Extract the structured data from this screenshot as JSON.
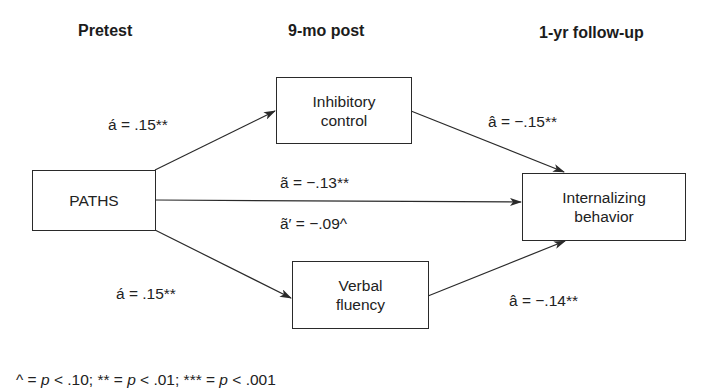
{
  "headings": {
    "pretest": "Pretest",
    "post9mo": "9-mo post",
    "followup": "1-yr follow-up"
  },
  "nodes": {
    "paths": {
      "label": "PATHS"
    },
    "inhibitory": {
      "line1": "Inhibitory",
      "line2": "control"
    },
    "verbal": {
      "line1": "Verbal",
      "line2": "fluency"
    },
    "internalizing": {
      "line1": "Internalizing",
      "line2": "behavior"
    }
  },
  "edges": {
    "paths_to_inhibitory": "á = .15**",
    "inhibitory_to_internalizing": "â = −.15**",
    "paths_to_internalizing_total": "ã = −.13**",
    "paths_to_internalizing_direct": "ã′ = −.09^",
    "paths_to_verbal": "á = .15**",
    "verbal_to_internalizing": "â = −.14**"
  },
  "footnote": {
    "caret_sym": "^ = ",
    "caret_p": "p",
    "caret_val": " < .10; ",
    "two_star_sym": "** = ",
    "two_star_p": "p",
    "two_star_val": " < .01; ",
    "three_star_sym": "*** = ",
    "three_star_p": "p",
    "three_star_val": " < .001"
  },
  "colors": {
    "line": "#2a2a2a",
    "text": "#222222",
    "background": "#ffffff"
  }
}
